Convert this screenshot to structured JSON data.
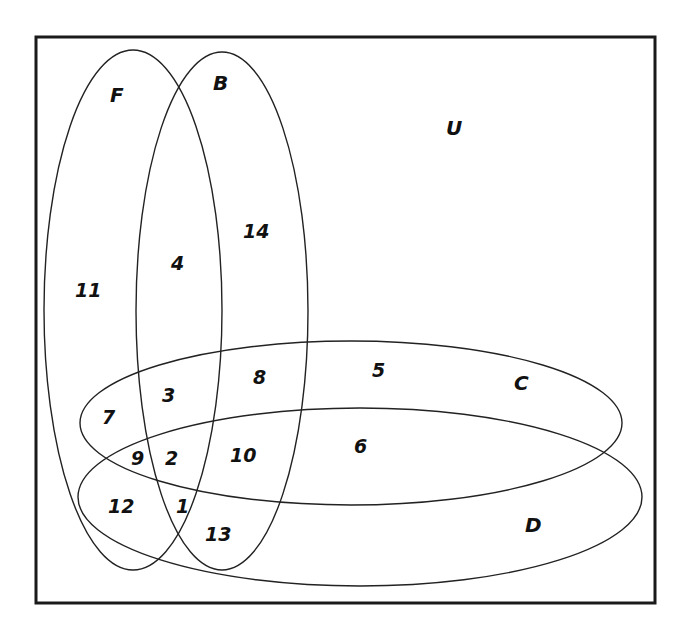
{
  "diagram": {
    "type": "venn",
    "universe_label": "U",
    "sets": [
      {
        "name": "F",
        "label": "F"
      },
      {
        "name": "B",
        "label": "B"
      },
      {
        "name": "C",
        "label": "C"
      },
      {
        "name": "D",
        "label": "D"
      }
    ],
    "regions": [
      {
        "value": "11",
        "sets": [
          "F"
        ]
      },
      {
        "value": "4",
        "sets": [
          "F",
          "B"
        ]
      },
      {
        "value": "14",
        "sets": [
          "B"
        ]
      },
      {
        "value": "7",
        "sets": [
          "F",
          "C"
        ]
      },
      {
        "value": "3",
        "sets": [
          "F",
          "B",
          "C"
        ]
      },
      {
        "value": "8",
        "sets": [
          "B",
          "C"
        ]
      },
      {
        "value": "5",
        "sets": [
          "C"
        ]
      },
      {
        "value": "9",
        "sets": [
          "F",
          "C",
          "D"
        ]
      },
      {
        "value": "2",
        "sets": [
          "F",
          "B",
          "C",
          "D"
        ]
      },
      {
        "value": "10",
        "sets": [
          "B",
          "C",
          "D"
        ]
      },
      {
        "value": "6",
        "sets": [
          "C",
          "D"
        ]
      },
      {
        "value": "12",
        "sets": [
          "F",
          "D"
        ]
      },
      {
        "value": "1",
        "sets": [
          "F",
          "B",
          "D"
        ]
      },
      {
        "value": "13",
        "sets": [
          "B",
          "D"
        ]
      }
    ],
    "colors": {
      "stroke": "#222222",
      "frame": "#1a1a1a",
      "background": "#ffffff"
    }
  }
}
